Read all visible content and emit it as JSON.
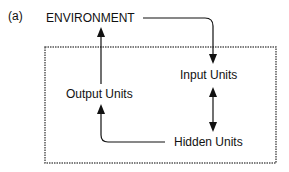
{
  "figure": {
    "panel_label": "(a)"
  },
  "nodes": {
    "environment": "ENVIRONMENT",
    "input_units": "Input Units",
    "output_units": "Output Units",
    "hidden_units": "Hidden Units"
  },
  "edges": [
    {
      "from": "environment",
      "to": "input_units",
      "type": "directed"
    },
    {
      "from": "input_units",
      "to": "hidden_units",
      "type": "bidirectional"
    },
    {
      "from": "hidden_units",
      "to": "output_units",
      "type": "directed"
    },
    {
      "from": "output_units",
      "to": "environment",
      "type": "directed"
    }
  ],
  "colors": {
    "line": "#111111",
    "box_border": "#555555"
  }
}
